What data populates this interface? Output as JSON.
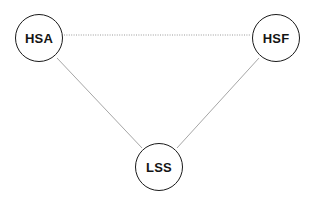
{
  "diagram": {
    "title": "",
    "background_color": "#ffffff",
    "width": 313,
    "height": 203,
    "nodes": [
      {
        "id": "hsa",
        "label": "HSA",
        "shape": "circle",
        "cx": 39,
        "cy": 38,
        "r": 24,
        "stroke_color": "#1a1a1a",
        "fill_color": "#ffffff",
        "text_color": "#141414"
      },
      {
        "id": "hsf",
        "label": "HSF",
        "shape": "circle",
        "cx": 276,
        "cy": 38,
        "r": 24,
        "stroke_color": "#1a1a1a",
        "fill_color": "#ffffff",
        "text_color": "#141414"
      },
      {
        "id": "lss",
        "label": "LSS",
        "shape": "circle",
        "cx": 159,
        "cy": 167,
        "r": 24,
        "stroke_color": "#1a1a1a",
        "fill_color": "#ffffff",
        "text_color": "#141414"
      }
    ],
    "edges": [
      {
        "id": "hsa-hsf",
        "from": "hsa",
        "to": "hsf",
        "style": "dotted",
        "arrow": "none",
        "color": "#9a9a9a",
        "width": 1,
        "x1": 64,
        "y1": 35,
        "x2": 251,
        "y2": 35
      },
      {
        "id": "hsa-lss",
        "from": "hsa",
        "to": "lss",
        "style": "solid",
        "arrow": "none",
        "color": "#a6a6a6",
        "width": 1,
        "x1": 57,
        "y1": 58,
        "x2": 142,
        "y2": 148
      },
      {
        "id": "hsf-lss",
        "from": "hsf",
        "to": "lss",
        "style": "solid",
        "arrow": "none",
        "color": "#a6a6a6",
        "width": 1,
        "x1": 259,
        "y1": 58,
        "x2": 177,
        "y2": 148
      }
    ]
  }
}
